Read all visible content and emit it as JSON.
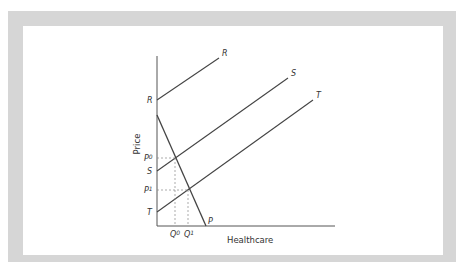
{
  "diagram": {
    "title": "",
    "axes": {
      "x_label": "Healthcare",
      "y_label": "Price"
    },
    "curves": {
      "R": {
        "label_end": "R",
        "label_start": "R"
      },
      "S": {
        "label_end": "S",
        "label_start": "S"
      },
      "T": {
        "label_end": "T",
        "label_start": "T"
      },
      "P": {
        "label_end": "P"
      }
    },
    "price_marks": {
      "p0": {
        "base": "P",
        "sup": "0"
      },
      "p1": {
        "base": "P",
        "sup": "1"
      }
    },
    "quantity_marks": {
      "q0": {
        "base": "Q",
        "sup": "0"
      },
      "q1": {
        "base": "Q",
        "sup": "1"
      }
    },
    "colors": {
      "frame": "#d6d6d6",
      "line": "#444444",
      "guide": "#888888"
    }
  }
}
